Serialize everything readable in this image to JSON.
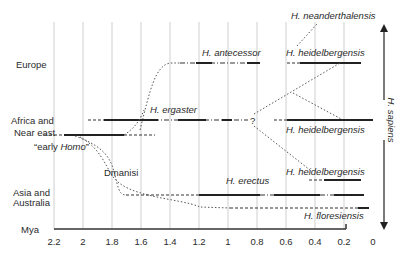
{
  "figure": {
    "type": "phylogeny-timeline",
    "x_axis": {
      "unit_label": "Mya",
      "ticks": [
        "2.2",
        "2",
        "1.8",
        "1.6",
        "1.4",
        "1.2",
        "1",
        "0.8",
        "0.6",
        "0.4",
        "0.2",
        "0"
      ]
    },
    "regions": {
      "europe": "Europe",
      "africa_line1": "Africa and",
      "africa_line2": "Near east",
      "asia_line1": "Asia and",
      "asia_line2": "Australia"
    },
    "species_labels": {
      "neanderthalensis": "H. neanderthalensis",
      "antecessor": "H. antecessor",
      "heidelbergensis_europe": "H. heidelbergensis",
      "ergaster": "H. ergaster",
      "heidelbergensis_africa": "H. heidelbergensis",
      "early_homo_prefix": "“early ",
      "early_homo_italic": "Homo",
      "early_homo_suffix": "”",
      "dmanisi": "Dmanisi",
      "erectus": "H. erectus",
      "heidelbergensis_asia": "H. heidelbergensis",
      "floresiensis": "H. floresiensis",
      "question_mark": "?"
    },
    "sapiens_label": "H. sapiens"
  }
}
